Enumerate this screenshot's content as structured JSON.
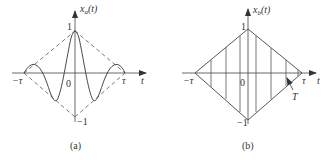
{
  "figure": {
    "panels": [
      {
        "id": "a",
        "caption": "(a)",
        "ylabel_main": "x",
        "ylabel_sub": "a",
        "ylabel_arg": "(t)",
        "xlabel": "t",
        "ytick_top": "1",
        "ytick_bottom": "−1",
        "origin": "0",
        "xtick_left": "−τ",
        "xtick_right": "τ",
        "description": "Oscillating waveform with peak 1 at t=0 bounded by dashed triangular envelope reaching 0 at ±τ"
      },
      {
        "id": "b",
        "caption": "(b)",
        "ylabel_main": "x",
        "ylabel_sub": "b",
        "ylabel_arg": "(t)",
        "xlabel": "t",
        "ytick_top": "1",
        "ytick_bottom": "−1",
        "origin": "0",
        "xtick_left": "−τ",
        "xtick_right": "τ",
        "period_label": "T",
        "description": "Diamond envelope from −τ to τ filled with vertical lines spaced by period T"
      }
    ]
  },
  "colors": {
    "stroke": "#444444",
    "background": "#ffffff"
  }
}
